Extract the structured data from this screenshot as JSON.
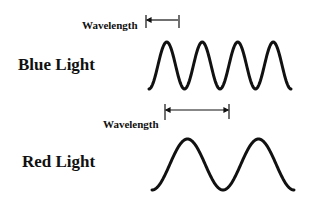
{
  "diagram": {
    "blue": {
      "title": "Blue Light",
      "wavelength_label": "Wavelength",
      "cycles": 4
    },
    "red": {
      "title": "Red Light",
      "wavelength_label": "Wavelength",
      "cycles": 2
    },
    "colors": {
      "ink": "#111111",
      "background": "#ffffff"
    }
  }
}
